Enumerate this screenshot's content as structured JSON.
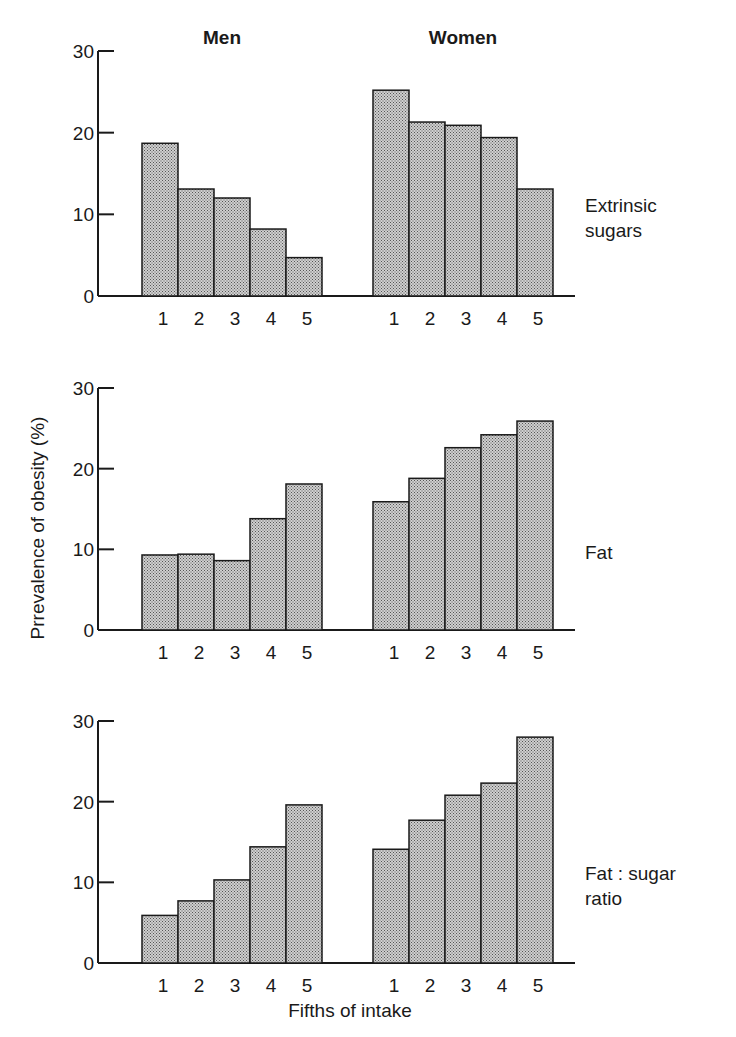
{
  "chart_data": {
    "type": "bar",
    "title": "",
    "ylabel": "Prrevalence of obesity (%)",
    "xlabel": "Fifths of intake",
    "ylim": [
      0,
      30
    ],
    "yticks": [
      0,
      10,
      20,
      30
    ],
    "categories": [
      "1",
      "2",
      "3",
      "4",
      "5"
    ],
    "groups": [
      "Men",
      "Women"
    ],
    "grid": false,
    "legend": null,
    "panels": [
      {
        "name": "Extrinsic sugars",
        "label_lines": [
          "Extrinsic",
          "sugars"
        ],
        "series": [
          {
            "name": "Men",
            "values": [
              18.7,
              13.1,
              12.0,
              8.2,
              4.7
            ]
          },
          {
            "name": "Women",
            "values": [
              25.2,
              21.3,
              20.9,
              19.4,
              13.1
            ]
          }
        ]
      },
      {
        "name": "Fat",
        "label_lines": [
          "Fat"
        ],
        "series": [
          {
            "name": "Men",
            "values": [
              9.3,
              9.4,
              8.6,
              13.8,
              18.1
            ]
          },
          {
            "name": "Women",
            "values": [
              15.9,
              18.8,
              22.6,
              24.2,
              25.9
            ]
          }
        ]
      },
      {
        "name": "Fat : sugar ratio",
        "label_lines": [
          "Fat : sugar",
          "ratio"
        ],
        "series": [
          {
            "name": "Men",
            "values": [
              5.9,
              7.7,
              10.3,
              14.4,
              19.6
            ]
          },
          {
            "name": "Women",
            "values": [
              14.1,
              17.7,
              20.8,
              22.3,
              28.0
            ]
          }
        ]
      }
    ]
  },
  "style": {
    "bar_fill": "#b8b8b8",
    "bar_stroke": "#1a1a1a",
    "axis_color": "#1a1a1a"
  }
}
